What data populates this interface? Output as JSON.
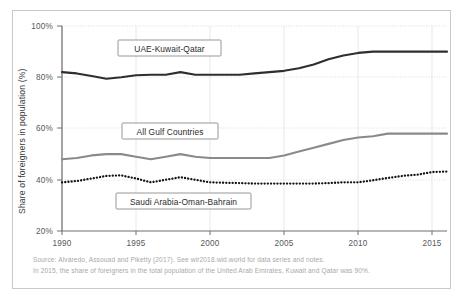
{
  "chart_data": {
    "type": "line",
    "title": "",
    "xlabel": "",
    "ylabel": "Share of foreigners in population (%)",
    "xlim": [
      1990,
      2016
    ],
    "ylim": [
      20,
      100
    ],
    "grid": true,
    "legend_position": "inline-boxed-labels",
    "x_ticks": [
      "1990",
      "1995",
      "2000",
      "2005",
      "2010",
      "2015"
    ],
    "y_ticks": [
      "20%",
      "40%",
      "60%",
      "80%",
      "100%"
    ],
    "x": [
      1990,
      1991,
      1992,
      1993,
      1994,
      1995,
      1996,
      1997,
      1998,
      1999,
      2000,
      2001,
      2002,
      2003,
      2004,
      2005,
      2006,
      2007,
      2008,
      2009,
      2010,
      2011,
      2012,
      2013,
      2014,
      2015,
      2016
    ],
    "series": [
      {
        "name": "UAE-Kuwait-Qatar",
        "color": "#2e2e2e",
        "style": "solid",
        "values": [
          82,
          81.5,
          80.5,
          79.4,
          80,
          80.8,
          81,
          81,
          82,
          81,
          81,
          81,
          81,
          81.5,
          82,
          82.5,
          83.5,
          85,
          87,
          88.5,
          89.5,
          90,
          90,
          90,
          90,
          90,
          90
        ]
      },
      {
        "name": "All Gulf Countries",
        "color": "#8a8a8a",
        "style": "solid",
        "values": [
          48,
          48.5,
          49.5,
          50,
          50,
          49,
          48,
          49,
          50,
          49,
          48.5,
          48.5,
          48.5,
          48.5,
          48.5,
          49.5,
          51,
          52.5,
          54,
          55.5,
          56.5,
          57,
          58,
          58,
          58,
          58,
          58
        ]
      },
      {
        "name": "Saudi Arabia-Oman-Bahrain",
        "color": "#141414",
        "style": "dotted",
        "values": [
          39,
          39.5,
          40.5,
          41.5,
          41.7,
          40.5,
          39,
          40,
          41,
          40,
          39,
          38.8,
          38.7,
          38.5,
          38.5,
          38.5,
          38.5,
          38.5,
          38.7,
          39,
          39,
          39.8,
          40.7,
          41.5,
          42,
          43,
          43.2
        ]
      }
    ],
    "annotations": [
      {
        "label": "UAE-Kuwait-Qatar",
        "x": 1997,
        "y": 91
      },
      {
        "label": "All Gulf Countries",
        "x": 1997,
        "y": 59
      },
      {
        "label": "Saudi Arabia-Oman-Bahrain",
        "x": 1999,
        "y": 32
      }
    ]
  },
  "notes": {
    "source": "Source:  Alvaredo, Assouad and Piketty (2017). See wir2018.wid.world for data series and notes.",
    "finding": "In 2015, the share of foreigners in the total population of the United Arab Emirates, Kuwait and Qatar was 90%."
  }
}
